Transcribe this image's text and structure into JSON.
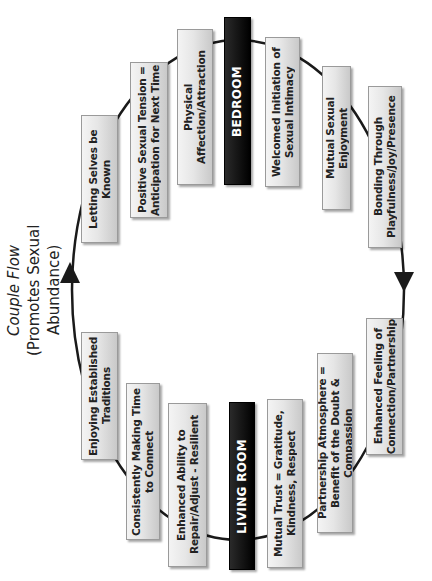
{
  "title": {
    "main": "Couple Flow",
    "subtitle": "(Promotes Sexual Abundance)"
  },
  "colors": {
    "ring": "#1a1a1a",
    "box_light": "#e6e6e6",
    "box_dark": "#111111",
    "box_dark_text": "#ffffff",
    "box_text": "#222222"
  },
  "bedroom": {
    "header": "BEDROOM",
    "items": [
      "Letting Selves be Known",
      "Positive Sexual Tension = Anticipation for Next Time",
      "Physical Affection/Attraction",
      "Welcomed Initiation of Sexual Intimacy",
      "Mutual Sexual Enjoyment",
      "Bonding Through Playfulness/Joy/Presence"
    ]
  },
  "living_room": {
    "header": "LIVING ROOM",
    "items": [
      "Enjoying Established Traditions",
      "Consistently Making Time to Connect",
      "Enhanced Ability to Repair/Adjust - Resilient",
      "Mutual Trust = Gratitude, Kindness, Respect",
      "Partnership Atmosphere = Benefit of the Doubt & Compassion",
      "Enhanced Feeling of Connection/Partnership"
    ]
  },
  "arrows": {
    "left": "arrow-up",
    "right": "arrow-down"
  }
}
